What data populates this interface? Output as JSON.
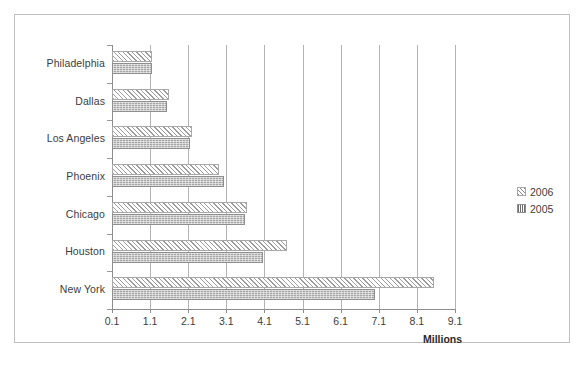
{
  "chart_data": {
    "type": "bar",
    "orientation": "horizontal",
    "title": "",
    "xlabel": "Millions",
    "ylabel": "",
    "categories": [
      "Philadelphia",
      "Dallas",
      "Los Angeles",
      "Phoenix",
      "Chicago",
      "Houston",
      "New York"
    ],
    "series": [
      {
        "name": "2006",
        "values": [
          1.15,
          1.6,
          2.2,
          2.9,
          3.65,
          4.7,
          8.55
        ]
      },
      {
        "name": "2005",
        "values": [
          1.15,
          1.55,
          2.15,
          3.05,
          3.6,
          4.05,
          7.0
        ]
      }
    ],
    "xticks": [
      "0.1",
      "1.1",
      "2.1",
      "3.1",
      "4.1",
      "5.1",
      "6.1",
      "7.1",
      "8.1",
      "9.1"
    ],
    "xtick_values": [
      0.1,
      1.1,
      2.1,
      3.1,
      4.1,
      5.1,
      6.1,
      7.1,
      8.1,
      9.1
    ],
    "xlim": [
      0.1,
      9.1
    ],
    "grid": "vertical",
    "legend_position": "right",
    "colors": {
      "series_2006_fill": "#ffffff",
      "series_2006_hatch": "#9d9d9d",
      "series_2005_fill": "#a6a6a6",
      "gridline": "#b3b3b3",
      "axis": "#8c8c8c",
      "border": "#bfbfbf",
      "text": "#3d3d3d"
    }
  },
  "legend": {
    "items": [
      {
        "label": "2006"
      },
      {
        "label": "2005"
      }
    ]
  },
  "axis": {
    "title": "Millions"
  }
}
